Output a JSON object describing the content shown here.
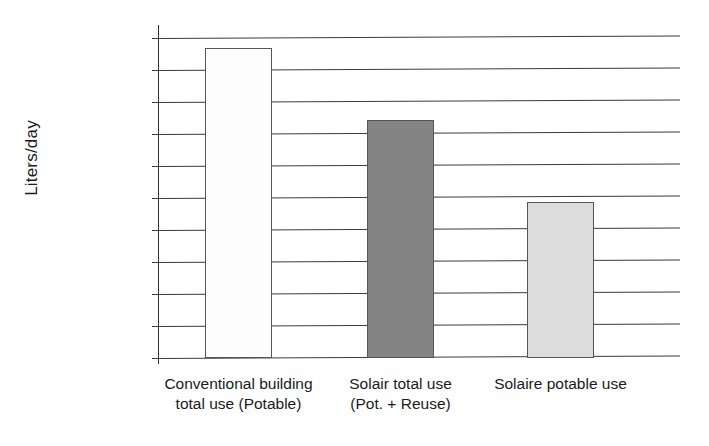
{
  "chart_data": {
    "type": "bar",
    "title": "",
    "xlabel": "",
    "ylabel": "Liters/day",
    "categories": [
      "Conventional building\ntotal use (Potable)",
      "Solair total use\n(Pot. +  Reuse)",
      "Solaire potable use"
    ],
    "values": [
      242000,
      186000,
      122000
    ],
    "ylim": [
      0,
      250000
    ],
    "ytick_values": [
      25000,
      50000,
      75000,
      100000,
      125000,
      150000,
      175000,
      200000,
      225000,
      250000
    ],
    "ytick_labels": [
      "25,000",
      "50,000",
      "75,000",
      "100,000",
      "125,000",
      "150,000",
      "175,000",
      "200,000",
      "225,000",
      "250,000"
    ],
    "grid": true,
    "legend": "none",
    "bar_colors": [
      "#fdfdfd",
      "#848484",
      "#dcdcdc"
    ],
    "bar_border_color": "#555555",
    "axis_color": "#3b3b3b"
  }
}
